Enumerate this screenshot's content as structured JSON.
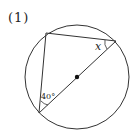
{
  "problem": {
    "label": "(1)"
  },
  "diagram": {
    "angle_x_label": "x",
    "angle_40_label": "40°",
    "circle": {
      "cx": 77,
      "cy": 77,
      "r": 52
    },
    "points": {
      "A": [
        46,
        33
      ],
      "B": [
        116,
        41
      ],
      "C": [
        39,
        113
      ]
    },
    "stroke_color": "#333333"
  }
}
